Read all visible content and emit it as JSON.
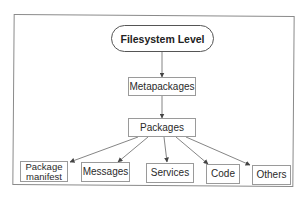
{
  "diagram": {
    "type": "hierarchy",
    "root": {
      "id": "filesystem",
      "label": "Filesystem Level",
      "shape": "rounded-pill"
    },
    "nodes": [
      {
        "id": "filesystem",
        "label": "Filesystem Level"
      },
      {
        "id": "metapackages",
        "label": "Metapackages"
      },
      {
        "id": "packages",
        "label": "Packages"
      },
      {
        "id": "manifest",
        "label": "Package manifest",
        "lines": [
          "Package",
          "manifest"
        ]
      },
      {
        "id": "messages",
        "label": "Messages"
      },
      {
        "id": "services",
        "label": "Services"
      },
      {
        "id": "code",
        "label": "Code"
      },
      {
        "id": "others",
        "label": "Others"
      }
    ],
    "edges": [
      {
        "from": "filesystem",
        "to": "metapackages"
      },
      {
        "from": "metapackages",
        "to": "packages"
      },
      {
        "from": "packages",
        "to": "manifest"
      },
      {
        "from": "packages",
        "to": "messages"
      },
      {
        "from": "packages",
        "to": "services"
      },
      {
        "from": "packages",
        "to": "code"
      },
      {
        "from": "packages",
        "to": "others"
      }
    ],
    "colors": {
      "stroke": "#555555",
      "box_border": "#9a9a9a",
      "text": "#2a2a2a",
      "background": "#ffffff"
    }
  }
}
